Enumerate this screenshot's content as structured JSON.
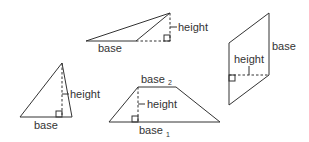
{
  "figures": {
    "obtuse_triangle": {
      "base_label": "base",
      "height_label": "height"
    },
    "parallelogram": {
      "base_label": "base",
      "height_label": "height"
    },
    "acute_triangle": {
      "base_label": "base",
      "height_label": "height"
    },
    "trapezoid": {
      "base1_label": "base",
      "base1_sub": "1",
      "base2_label": "base",
      "base2_sub": "2",
      "height_label": "height"
    }
  },
  "colors": {
    "stroke": "#333333",
    "background": "#ffffff"
  }
}
